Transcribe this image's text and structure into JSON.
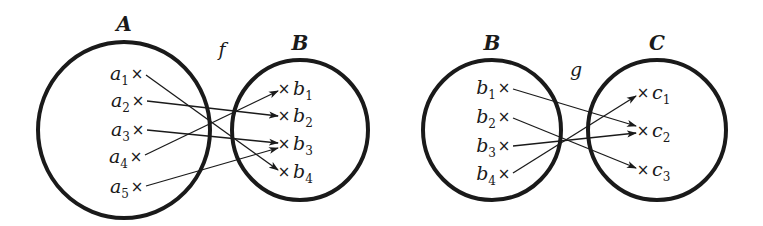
{
  "colors": {
    "ink": "#1a1a1a",
    "background": "#ffffff"
  },
  "diagrams": [
    {
      "mapping_label": "f",
      "mapping_label_pos": [
        222,
        56
      ],
      "sets": [
        {
          "name": "A",
          "circle": {
            "cx": 124,
            "cy": 130,
            "rx": 86,
            "ry": 88
          },
          "label_pos": [
            124,
            31
          ],
          "elements": [
            {
              "base": "a",
              "sub": "1",
              "x": 137,
              "y": 74,
              "side": "left"
            },
            {
              "base": "a",
              "sub": "2",
              "x": 138,
              "y": 101,
              "side": "left"
            },
            {
              "base": "a",
              "sub": "3",
              "x": 138,
              "y": 130,
              "side": "left"
            },
            {
              "base": "a",
              "sub": "4",
              "x": 136,
              "y": 157,
              "side": "left"
            },
            {
              "base": "a",
              "sub": "5",
              "x": 137,
              "y": 187,
              "side": "left"
            }
          ]
        },
        {
          "name": "B",
          "circle": {
            "cx": 300,
            "cy": 130,
            "rx": 68,
            "ry": 70
          },
          "label_pos": [
            300,
            50
          ],
          "elements": [
            {
              "base": "b",
              "sub": "1",
              "x": 284,
              "y": 89,
              "side": "right"
            },
            {
              "base": "b",
              "sub": "2",
              "x": 284,
              "y": 116,
              "side": "right"
            },
            {
              "base": "b",
              "sub": "3",
              "x": 284,
              "y": 144,
              "side": "right"
            },
            {
              "base": "b",
              "sub": "4",
              "x": 284,
              "y": 172,
              "side": "right"
            }
          ]
        }
      ],
      "arrows": [
        {
          "from": "a1",
          "to": "b4",
          "x1": 146,
          "y1": 75,
          "x2": 278,
          "y2": 170
        },
        {
          "from": "a2",
          "to": "b2",
          "x1": 147,
          "y1": 101,
          "x2": 278,
          "y2": 116
        },
        {
          "from": "a3",
          "to": "b3",
          "x1": 147,
          "y1": 130,
          "x2": 278,
          "y2": 143
        },
        {
          "from": "a4",
          "to": "b1",
          "x1": 145,
          "y1": 155,
          "x2": 278,
          "y2": 91
        },
        {
          "from": "a5",
          "to": "b3",
          "x1": 146,
          "y1": 186,
          "x2": 278,
          "y2": 148
        }
      ]
    },
    {
      "mapping_label": "g",
      "mapping_label_pos": [
        576,
        76
      ],
      "sets": [
        {
          "name": "B",
          "circle": {
            "cx": 492,
            "cy": 130,
            "rx": 69,
            "ry": 70
          },
          "label_pos": [
            492,
            50
          ],
          "elements": [
            {
              "base": "b",
              "sub": "1",
              "x": 504,
              "y": 88,
              "side": "left"
            },
            {
              "base": "b",
              "sub": "2",
              "x": 504,
              "y": 117,
              "side": "left"
            },
            {
              "base": "b",
              "sub": "3",
              "x": 504,
              "y": 146,
              "side": "left"
            },
            {
              "base": "b",
              "sub": "4",
              "x": 504,
              "y": 174,
              "side": "left"
            }
          ]
        },
        {
          "name": "C",
          "circle": {
            "cx": 657,
            "cy": 130,
            "rx": 69,
            "ry": 70
          },
          "label_pos": [
            657,
            50
          ],
          "elements": [
            {
              "base": "c",
              "sub": "1",
              "x": 643,
              "y": 93,
              "side": "right"
            },
            {
              "base": "c",
              "sub": "2",
              "x": 643,
              "y": 131,
              "side": "right"
            },
            {
              "base": "c",
              "sub": "3",
              "x": 643,
              "y": 170,
              "side": "right"
            }
          ]
        }
      ],
      "arrows": [
        {
          "from": "b1",
          "to": "c2",
          "x1": 513,
          "y1": 89,
          "x2": 636,
          "y2": 126
        },
        {
          "from": "b2",
          "to": "c3",
          "x1": 513,
          "y1": 118,
          "x2": 636,
          "y2": 168
        },
        {
          "from": "b3",
          "to": "c2",
          "x1": 513,
          "y1": 146,
          "x2": 636,
          "y2": 133
        },
        {
          "from": "b4",
          "to": "c1",
          "x1": 513,
          "y1": 173,
          "x2": 636,
          "y2": 96
        }
      ]
    }
  ]
}
